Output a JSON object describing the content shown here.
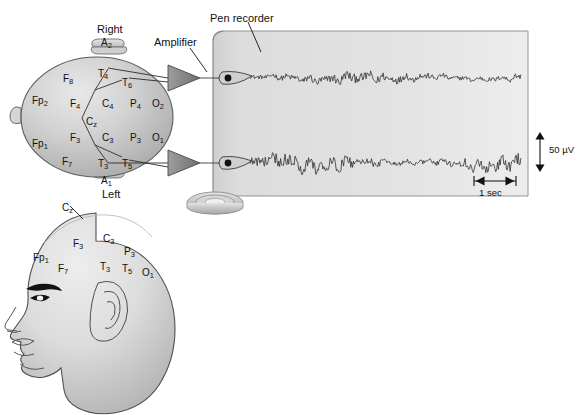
{
  "figure": {
    "callouts": {
      "pen_recorder": "Pen recorder",
      "amplifier": "Amplifier"
    },
    "orientation": {
      "right": "Right",
      "left": "Left"
    },
    "ear_electrodes": {
      "right_ear": "A2",
      "left_ear": "A1"
    },
    "scale_markers": {
      "amplitude": "50 µV",
      "time": "1 sec"
    }
  },
  "top_view": {
    "name": "head-top-view",
    "electrodes": [
      {
        "id": "Fp2",
        "base": "Fp",
        "sub": "2",
        "x": 32,
        "y": 96
      },
      {
        "id": "Fp1",
        "base": "Fp",
        "sub": "1",
        "x": 32,
        "y": 139
      },
      {
        "id": "F8",
        "base": "F",
        "sub": "8",
        "x": 63,
        "y": 74
      },
      {
        "id": "F4",
        "base": "F",
        "sub": "4",
        "x": 70,
        "y": 99
      },
      {
        "id": "F3",
        "base": "F",
        "sub": "3",
        "x": 70,
        "y": 133
      },
      {
        "id": "F7",
        "base": "F",
        "sub": "7",
        "x": 62,
        "y": 157
      },
      {
        "id": "T4",
        "base": "T",
        "sub": "4",
        "x": 98,
        "y": 69
      },
      {
        "id": "T6",
        "base": "T",
        "sub": "6",
        "x": 122,
        "y": 78
      },
      {
        "id": "T3",
        "base": "T",
        "sub": "3",
        "x": 98,
        "y": 159
      },
      {
        "id": "T5",
        "base": "T",
        "sub": "5",
        "x": 122,
        "y": 159
      },
      {
        "id": "C4",
        "base": "C",
        "sub": "4",
        "x": 102,
        "y": 99
      },
      {
        "id": "Cz",
        "base": "C",
        "sub": "z",
        "x": 86,
        "y": 117
      },
      {
        "id": "C3",
        "base": "C",
        "sub": "3",
        "x": 102,
        "y": 133
      },
      {
        "id": "P4",
        "base": "P",
        "sub": "4",
        "x": 130,
        "y": 99
      },
      {
        "id": "P3",
        "base": "P",
        "sub": "3",
        "x": 130,
        "y": 133
      },
      {
        "id": "O2",
        "base": "O",
        "sub": "2",
        "x": 152,
        "y": 99
      },
      {
        "id": "O1",
        "base": "O",
        "sub": "1",
        "x": 152,
        "y": 133
      }
    ]
  },
  "side_view": {
    "name": "head-side-view",
    "electrodes": [
      {
        "id": "Cz",
        "base": "C",
        "sub": "z",
        "x": 62,
        "y": 203
      },
      {
        "id": "Fp1",
        "base": "Fp",
        "sub": "1",
        "x": 33,
        "y": 253
      },
      {
        "id": "F7",
        "base": "F",
        "sub": "7",
        "x": 58,
        "y": 264
      },
      {
        "id": "F3",
        "base": "F",
        "sub": "3",
        "x": 73,
        "y": 239
      },
      {
        "id": "C3",
        "base": "C",
        "sub": "3",
        "x": 103,
        "y": 234
      },
      {
        "id": "P3",
        "base": "P",
        "sub": "3",
        "x": 124,
        "y": 247
      },
      {
        "id": "T3",
        "base": "T",
        "sub": "3",
        "x": 100,
        "y": 262
      },
      {
        "id": "T5",
        "base": "T",
        "sub": "5",
        "x": 122,
        "y": 264
      },
      {
        "id": "O1",
        "base": "O",
        "sub": "1",
        "x": 142,
        "y": 268
      }
    ]
  },
  "recorder": {
    "name": "pen-recorder",
    "channels": [
      {
        "id": "channel-1",
        "source": "T4-T6",
        "y": 72
      },
      {
        "id": "channel-2",
        "source": "T3-T5",
        "y": 157
      }
    ]
  },
  "colors": {
    "paper": "#dcdcdc",
    "head_fill": "#c9c9c9",
    "trace": "#3a3a3a",
    "outline": "#3d3d3d",
    "text": "#111111"
  }
}
